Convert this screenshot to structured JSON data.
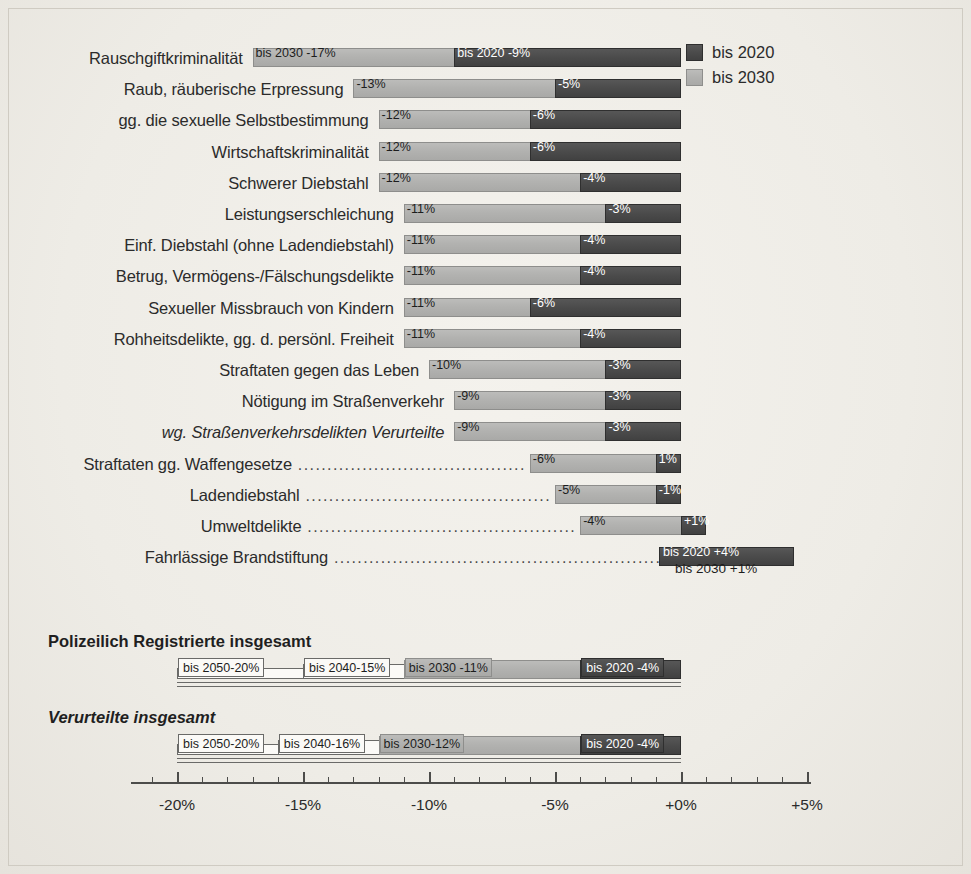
{
  "legend": {
    "items": [
      {
        "label": "bis 2020",
        "swatch": "dark",
        "color": "#4b4b4b"
      },
      {
        "label": "bis 2030",
        "swatch": "light",
        "color": "#b2b2b0"
      }
    ]
  },
  "axis": {
    "ticks": [
      "-20%",
      "-15%",
      "-10%",
      "-5%",
      "+0%",
      "+5%"
    ],
    "min": -22.0,
    "max": 5.5
  },
  "groups": [
    {
      "label": "Polizeilich Registrierte insgesamt",
      "style": "bold"
    },
    {
      "label": "Verurteilte insgesamt",
      "style": "bold-italic"
    }
  ],
  "chart_data": {
    "type": "bar",
    "title": "",
    "xlabel": "",
    "ylabel": "",
    "orientation": "horizontal",
    "grid": false,
    "legend_position": "top-right",
    "xlim": [
      -22.0,
      5.5
    ],
    "xticks": [
      -20,
      -15,
      -10,
      -5,
      0,
      5
    ],
    "xtick_labels": [
      "-20%",
      "-15%",
      "-10%",
      "-5%",
      "+0%",
      "+5%"
    ],
    "series": [
      {
        "name": "bis 2020",
        "color": "#4b4b4b"
      },
      {
        "name": "bis 2030",
        "color": "#b2b2b0"
      },
      {
        "name": "bis 2040",
        "color": "#fbfaf7"
      },
      {
        "name": "bis 2050",
        "color": "#fbfaf7"
      }
    ],
    "rows": [
      {
        "category": "Rauschgiftkriminalität",
        "italic": false,
        "leader": false,
        "bis2030": -17,
        "bis2020": -9,
        "label2030": "bis 2030  -17%",
        "label2020": "bis 2020  -9%"
      },
      {
        "category": "Raub, räuberische Erpressung",
        "italic": false,
        "leader": false,
        "bis2030": -13,
        "bis2020": -5,
        "label2030": "-13%",
        "label2020": "-5%"
      },
      {
        "category": "gg. die sexuelle Selbstbestimmung",
        "italic": false,
        "leader": false,
        "bis2030": -12,
        "bis2020": -6,
        "label2030": "-12%",
        "label2020": "-6%"
      },
      {
        "category": "Wirtschaftskriminalität",
        "italic": false,
        "leader": false,
        "bis2030": -12,
        "bis2020": -6,
        "label2030": "-12%",
        "label2020": "-6%"
      },
      {
        "category": "Schwerer Diebstahl",
        "italic": false,
        "leader": false,
        "bis2030": -12,
        "bis2020": -4,
        "label2030": "-12%",
        "label2020": "-4%"
      },
      {
        "category": "Leistungserschleichung",
        "italic": false,
        "leader": false,
        "bis2030": -11,
        "bis2020": -3,
        "label2030": "-11%",
        "label2020": "-3%"
      },
      {
        "category": "Einf. Diebstahl (ohne Ladendiebstahl)",
        "italic": false,
        "leader": false,
        "bis2030": -11,
        "bis2020": -4,
        "label2030": "-11%",
        "label2020": "-4%"
      },
      {
        "category": "Betrug, Vermögens-/Fälschungsdelikte",
        "italic": false,
        "leader": false,
        "bis2030": -11,
        "bis2020": -4,
        "label2030": "-11%",
        "label2020": "-4%"
      },
      {
        "category": "Sexueller Missbrauch von Kindern",
        "italic": false,
        "leader": false,
        "bis2030": -11,
        "bis2020": -6,
        "label2030": "-11%",
        "label2020": "-6%"
      },
      {
        "category": "Rohheitsdelikte, gg. d. persönl. Freiheit",
        "italic": false,
        "leader": false,
        "bis2030": -11,
        "bis2020": -4,
        "label2030": "-11%",
        "label2020": "-4%"
      },
      {
        "category": "Straftaten gegen das Leben",
        "italic": false,
        "leader": false,
        "bis2030": -10,
        "bis2020": -3,
        "label2030": "-10%",
        "label2020": "-3%"
      },
      {
        "category": "Nötigung im Straßenverkehr",
        "italic": false,
        "leader": false,
        "bis2030": -9,
        "bis2020": -3,
        "label2030": "-9%",
        "label2020": "-3%"
      },
      {
        "category": "wg. Straßenverkehrsdelikten Verurteilte",
        "italic": true,
        "leader": false,
        "bis2030": -9,
        "bis2020": -3,
        "label2030": "-9%",
        "label2020": "-3%"
      },
      {
        "category": "Straftaten gg. Waffengesetze",
        "italic": false,
        "leader": true,
        "bis2030": -6,
        "bis2020": -1,
        "label2030": "-6%",
        "label2020": "1%"
      },
      {
        "category": "Ladendiebstahl",
        "italic": false,
        "leader": true,
        "bis2030": -5,
        "bis2020": -1,
        "label2030": "-5%",
        "label2020": "-1%"
      },
      {
        "category": "Umweltdelikte",
        "italic": false,
        "leader": true,
        "bis2030": -4,
        "bis2020": 1,
        "label2030": "-4%",
        "label2020": "+1%"
      },
      {
        "category": "Fahrlässige Brandstiftung",
        "italic": false,
        "leader": true,
        "bis2030": 1,
        "bis2020": 4,
        "label2030": "bis 2030 +1%",
        "label2020": "bis 2020 +4%"
      }
    ],
    "totals": [
      {
        "group": "Polizeilich Registrierte insgesamt",
        "italic": false,
        "bis2020": -4,
        "bis2030": -11,
        "bis2040": -15,
        "bis2050": -20,
        "label2020": "bis 2020  -4%",
        "label2030": "bis 2030  -11%",
        "label2040": "bis 2040-15%",
        "label2050": "bis 2050-20%"
      },
      {
        "group": "Verurteilte insgesamt",
        "italic": true,
        "bis2020": -4,
        "bis2030": -12,
        "bis2040": -16,
        "bis2050": -20,
        "label2020": "bis 2020  -4%",
        "label2030": "bis 2030-12%",
        "label2040": "bis 2040-16%",
        "label2050": "bis 2050-20%"
      }
    ]
  }
}
